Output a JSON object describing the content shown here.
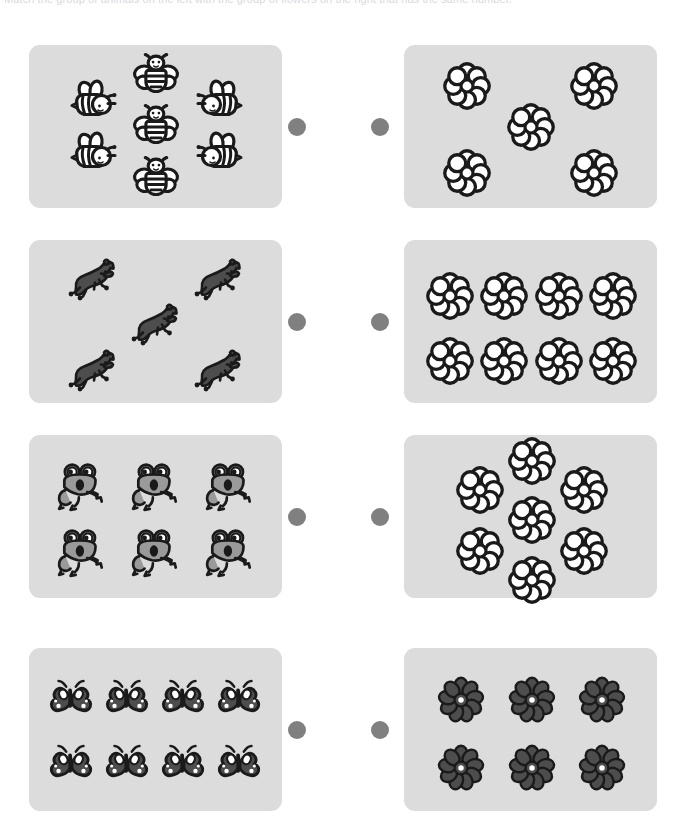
{
  "page": {
    "header_text": "Match the group of animals on the left with the group of flowers on the right that has the same number.",
    "background_color": "#ffffff",
    "panel_color": "#dcdcdc",
    "connector_dot_color": "#808080",
    "ink_color": "#1a1a1a"
  },
  "connectors": {
    "left_dot_label": "connector dot left",
    "right_dot_label": "connector dot right"
  },
  "rows": [
    {
      "index": 1,
      "left": {
        "item_type": "bee",
        "item_label": "bee",
        "count": 7,
        "layout": "two-left two-right three-center",
        "fill": "#ffffff",
        "positions": [
          {
            "x": 67,
            "y": 56,
            "variant": "side-left"
          },
          {
            "x": 67,
            "y": 108,
            "variant": "side-left"
          },
          {
            "x": 127,
            "y": 30,
            "variant": "front"
          },
          {
            "x": 127,
            "y": 81,
            "variant": "front"
          },
          {
            "x": 127,
            "y": 133,
            "variant": "front"
          },
          {
            "x": 188,
            "y": 56,
            "variant": "side-right"
          },
          {
            "x": 188,
            "y": 108,
            "variant": "side-right"
          }
        ]
      },
      "right": {
        "item_type": "flower",
        "item_label": "flower",
        "count": 5,
        "layout": "quincunx",
        "fill": "#ffffff",
        "positions": [
          {
            "x": 63,
            "y": 41
          },
          {
            "x": 190,
            "y": 41
          },
          {
            "x": 127,
            "y": 82
          },
          {
            "x": 63,
            "y": 128
          },
          {
            "x": 190,
            "y": 128
          }
        ]
      }
    },
    {
      "index": 2,
      "left": {
        "item_type": "horse",
        "item_label": "horse",
        "count": 5,
        "layout": "quincunx",
        "fill": "#4d4d4d",
        "positions": [
          {
            "x": 64,
            "y": 40
          },
          {
            "x": 190,
            "y": 40
          },
          {
            "x": 127,
            "y": 85
          },
          {
            "x": 64,
            "y": 131
          },
          {
            "x": 190,
            "y": 131
          }
        ]
      },
      "right": {
        "item_type": "flower",
        "item_label": "flower",
        "count": 8,
        "layout": "grid-4x2",
        "fill": "#ffffff",
        "positions": [
          {
            "x": 46,
            "y": 56
          },
          {
            "x": 100,
            "y": 56
          },
          {
            "x": 155,
            "y": 56
          },
          {
            "x": 209,
            "y": 56
          },
          {
            "x": 46,
            "y": 121
          },
          {
            "x": 100,
            "y": 121
          },
          {
            "x": 155,
            "y": 121
          },
          {
            "x": 209,
            "y": 121
          }
        ]
      }
    },
    {
      "index": 3,
      "left": {
        "item_type": "frog",
        "item_label": "frog",
        "count": 6,
        "layout": "grid-3x2",
        "fill": "#9a9a9a",
        "positions": [
          {
            "x": 53,
            "y": 52
          },
          {
            "x": 127,
            "y": 52
          },
          {
            "x": 201,
            "y": 52
          },
          {
            "x": 53,
            "y": 118
          },
          {
            "x": 127,
            "y": 118
          },
          {
            "x": 201,
            "y": 118
          }
        ]
      },
      "right": {
        "item_type": "flower",
        "item_label": "flower",
        "count": 7,
        "layout": "two-left two-right three-center",
        "fill": "#ffffff",
        "positions": [
          {
            "x": 76,
            "y": 55
          },
          {
            "x": 76,
            "y": 116
          },
          {
            "x": 128,
            "y": 26
          },
          {
            "x": 128,
            "y": 85
          },
          {
            "x": 128,
            "y": 145
          },
          {
            "x": 180,
            "y": 55
          },
          {
            "x": 180,
            "y": 116
          }
        ]
      }
    },
    {
      "index": 4,
      "left": {
        "item_type": "butterfly",
        "item_label": "butterfly",
        "count": 8,
        "layout": "grid-4x2",
        "fill": "#4d4d4d",
        "positions": [
          {
            "x": 42,
            "y": 55
          },
          {
            "x": 98,
            "y": 55
          },
          {
            "x": 154,
            "y": 55
          },
          {
            "x": 210,
            "y": 55
          },
          {
            "x": 42,
            "y": 120
          },
          {
            "x": 98,
            "y": 120
          },
          {
            "x": 154,
            "y": 120
          },
          {
            "x": 210,
            "y": 120
          }
        ]
      },
      "right": {
        "item_type": "flower",
        "item_label": "flower",
        "count": 6,
        "layout": "grid-3x2",
        "fill": "#4d4d4d",
        "positions": [
          {
            "x": 57,
            "y": 52
          },
          {
            "x": 128,
            "y": 52
          },
          {
            "x": 198,
            "y": 52
          },
          {
            "x": 57,
            "y": 120
          },
          {
            "x": 128,
            "y": 120
          },
          {
            "x": 198,
            "y": 120
          }
        ]
      }
    }
  ],
  "chart_data": {
    "type": "table",
    "categories": [
      "Row 1",
      "Row 2",
      "Row 3",
      "Row 4"
    ],
    "series": [
      {
        "name": "Left group count",
        "values": [
          7,
          5,
          6,
          8
        ]
      },
      {
        "name": "Right group count",
        "values": [
          5,
          8,
          7,
          6
        ]
      }
    ],
    "left_item_types": [
      "bee",
      "horse",
      "frog",
      "butterfly"
    ],
    "right_item_types": [
      "flower",
      "flower",
      "flower",
      "flower"
    ],
    "xlabel": "",
    "ylabel": "Number of objects",
    "grid": false,
    "legend": "none"
  }
}
